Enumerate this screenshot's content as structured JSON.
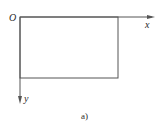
{
  "diagram": {
    "origin_label": "O",
    "x_axis_label": "x",
    "y_axis_label": "y",
    "caption": "a)",
    "stroke_color": "#555555",
    "text_color": "#2a2a2a"
  }
}
